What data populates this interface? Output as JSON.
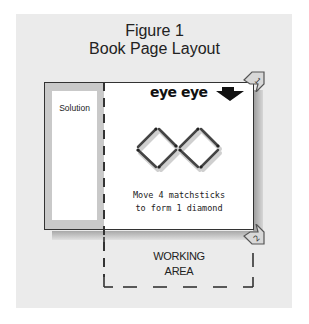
{
  "figure": {
    "title_line1": "Figure 1",
    "title_line2": "Book Page Layout"
  },
  "page": {
    "solution_label": "Solution",
    "brand_text": "eye eye",
    "puzzle_caption_line1": "Move 4 matchsticks",
    "puzzle_caption_line2": "to form 1 diamond",
    "corner_markers": [
      "1",
      "2"
    ]
  },
  "working_area": {
    "line1": "WORKING",
    "line2": "AREA"
  },
  "colors": {
    "background_panel": "#ebebeb",
    "page": "#ffffff",
    "sidebar": "#c9c9c9",
    "ink": "#222222"
  }
}
